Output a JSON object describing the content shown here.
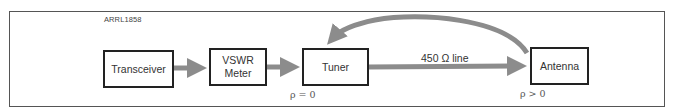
{
  "figure": {
    "id_label": "ARRL1858"
  },
  "nodes": [
    {
      "id": "transceiver",
      "label": "Transceiver"
    },
    {
      "id": "vswr-meter",
      "label_line1": "VSWR",
      "label_line2": "Meter"
    },
    {
      "id": "tuner",
      "label": "Tuner"
    },
    {
      "id": "antenna",
      "label": "Antenna"
    }
  ],
  "edges": [
    {
      "from": "transceiver",
      "to": "vswr-meter",
      "label": ""
    },
    {
      "from": "vswr-meter",
      "to": "tuner",
      "label": ""
    },
    {
      "from": "tuner",
      "to": "antenna",
      "label": "450 Ω line"
    },
    {
      "from": "antenna",
      "to": "tuner",
      "label": "",
      "style": "curved-reflection"
    }
  ],
  "annotations": {
    "tuner_rho": "ρ = 0",
    "antenna_rho": "ρ > 0"
  },
  "colors": {
    "arrow": "#8c8c8c",
    "box_border": "#222222",
    "frame": "#555555"
  }
}
